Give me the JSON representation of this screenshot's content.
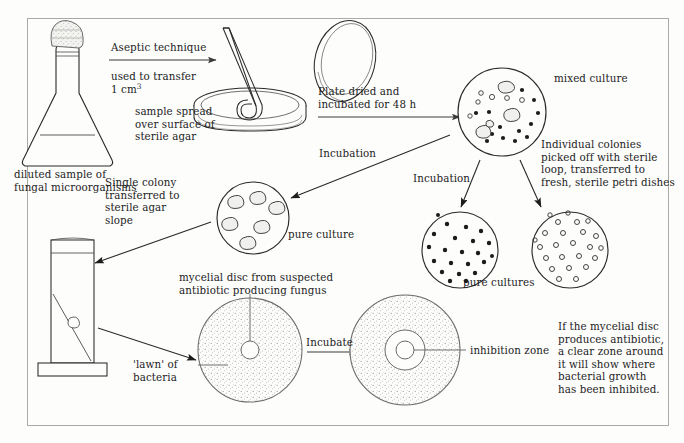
{
  "diagram": {
    "frame_border_color": "#a9a9a6",
    "ink_color": "#1c1c1c",
    "background_color": "#fdfdfc"
  },
  "labels": {
    "flask_caption": "diluted sample of\nfungal microorganisms",
    "aseptic_technique": "Aseptic technique",
    "used_to_transfer": "used to transfer",
    "one_cm3_prefix": "1 cm",
    "one_cm3_sup": "3",
    "sample_spread": "sample spread\nover surface of\nsterile agar",
    "plate_dried": "Plate dried and\nincubated for 48 h",
    "mixed_culture": "mixed culture",
    "individual_colonies": "Individual colonies\npicked off with sterile\nloop, transferred to\nfresh, sterile petri dishes",
    "incubation_left": "Incubation",
    "incubation_right": "Incubation",
    "pure_culture": "pure culture",
    "pure_cultures": "pure cultures",
    "single_colony": "Single colony\ntransferred to\nsterile agar\nslope",
    "mycelial_disc": "mycelial disc from suspected\nantibiotic producing fungus",
    "lawn_of_bacteria": "'lawn' of\nbacteria",
    "incubate": "Incubate",
    "inhibition_zone": "inhibition zone",
    "conclusion": "If the mycelial disc\nproduces antibiotic,\na clear zone around\nit will show where\nbacterial growth\nhas been inhibited."
  },
  "figures": {
    "flask": {
      "name": "conical flask with cotton wool bung",
      "liquid_level": "filled to shoulder"
    },
    "petri_dish_open": {
      "name": "petri dish base with spreader and tilted lid"
    },
    "mixed_culture_plate": {
      "name": "plate with mixed colonies",
      "small_dots": 14,
      "rings": 6,
      "irregular_colonies": 4
    },
    "pure_culture_plate_left": {
      "name": "plate with six irregular fungal colonies",
      "colonies": 6
    },
    "pure_culture_dots_plate": {
      "name": "plate with filled dot colonies",
      "colonies": 22
    },
    "pure_culture_rings_plate": {
      "name": "plate with open ring colonies",
      "colonies": 24
    },
    "agar_slope_tube": {
      "name": "test tube with sloped agar"
    },
    "lawn_plate": {
      "name": "stippled lawn plate with central mycelial disc"
    },
    "inhibition_plate": {
      "name": "stippled lawn plate with clear inhibition zone around disc"
    }
  }
}
